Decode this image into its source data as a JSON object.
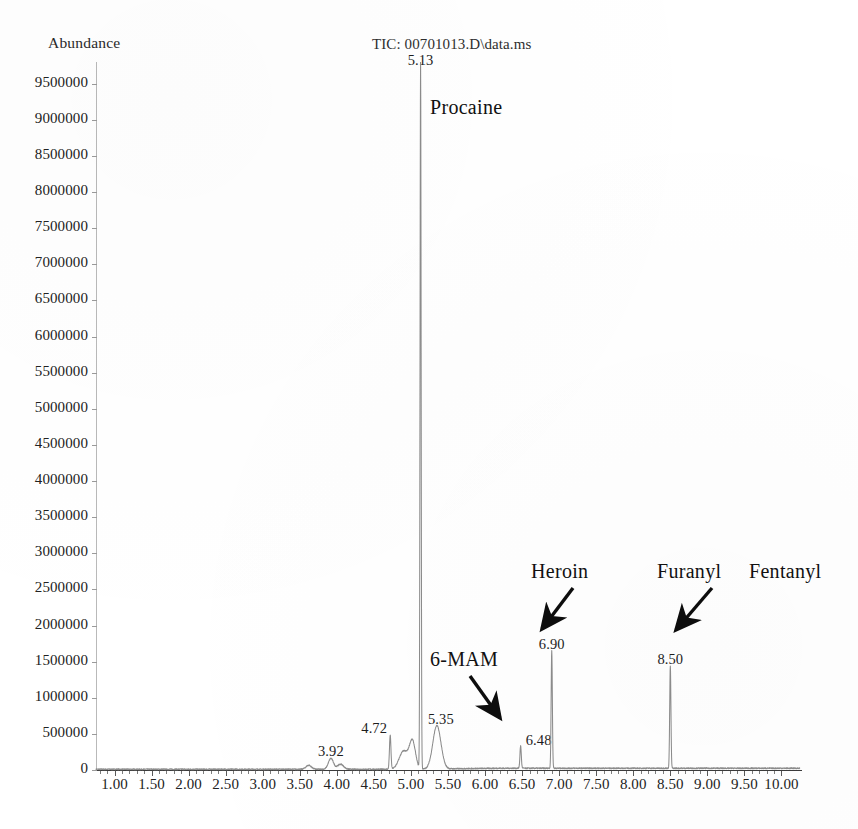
{
  "chart_data": {
    "type": "line",
    "title": "TIC: 00701013.D\\data.ms",
    "ylabel": "Abundance",
    "xlabel": "",
    "xlim": [
      0.75,
      10.25
    ],
    "ylim": [
      0,
      9800000
    ],
    "grid": false,
    "legend": "none",
    "x_ticks": [
      "1.00",
      "1.50",
      "2.00",
      "2.50",
      "3.00",
      "3.50",
      "4.00",
      "4.50",
      "5.00",
      "5.50",
      "6.00",
      "6.50",
      "7.00",
      "7.50",
      "8.00",
      "8.50",
      "9.00",
      "9.50",
      "10.00"
    ],
    "x_tick_values": [
      1.0,
      1.5,
      2.0,
      2.5,
      3.0,
      3.5,
      4.0,
      4.5,
      5.0,
      5.5,
      6.0,
      6.5,
      7.0,
      7.5,
      8.0,
      8.5,
      9.0,
      9.5,
      10.0
    ],
    "y_ticks": [
      "0",
      "500000",
      "1000000",
      "1500000",
      "2000000",
      "2500000",
      "3000000",
      "3500000",
      "4000000",
      "4500000",
      "5000000",
      "5500000",
      "6000000",
      "6500000",
      "7000000",
      "7500000",
      "8000000",
      "8500000",
      "9000000",
      "9500000"
    ],
    "y_tick_values": [
      0,
      500000,
      1000000,
      1500000,
      2000000,
      2500000,
      3000000,
      3500000,
      4000000,
      4500000,
      5000000,
      5500000,
      6000000,
      6500000,
      7000000,
      7500000,
      8000000,
      8500000,
      9000000,
      9500000
    ],
    "peaks": [
      {
        "label": "3.92",
        "rt": 3.92,
        "height": 150000,
        "width": 0.075,
        "label_dx": 0,
        "label_dy": -16
      },
      {
        "label": "4.72",
        "rt": 4.72,
        "height": 470000,
        "width": 0.022,
        "label_dx": -16,
        "label_dy": -16
      },
      {
        "label": "5.13",
        "rt": 5.13,
        "height": 9800000,
        "width": 0.016,
        "label_dx": 0,
        "label_dy": -14
      },
      {
        "label": "5.35",
        "rt": 5.35,
        "height": 600000,
        "width": 0.12,
        "label_dx": 4,
        "label_dy": -16
      },
      {
        "label": "6.48",
        "rt": 6.48,
        "height": 310000,
        "width": 0.02,
        "label_dx": 18,
        "label_dy": -16
      },
      {
        "label": "6.90",
        "rt": 6.9,
        "height": 1630000,
        "width": 0.018,
        "label_dx": 0,
        "label_dy": -16
      },
      {
        "label": "8.50",
        "rt": 8.5,
        "height": 1420000,
        "width": 0.018,
        "label_dx": 0,
        "label_dy": -16
      }
    ],
    "shoulders": [
      {
        "rt": 4.9,
        "height": 250000,
        "width": 0.13
      },
      {
        "rt": 5.02,
        "height": 380000,
        "width": 0.09
      },
      {
        "rt": 3.62,
        "height": 55000,
        "width": 0.08
      },
      {
        "rt": 4.05,
        "height": 70000,
        "width": 0.09
      }
    ],
    "annotations": [
      {
        "text": "Procaine",
        "x": 430,
        "y": 96,
        "arrow": false
      },
      {
        "text": "6-MAM",
        "x": 430,
        "y": 648,
        "arrow": true,
        "arrow_from": [
          470,
          676
        ],
        "arrow_to": [
          500,
          718
        ]
      },
      {
        "text": "Heroin",
        "x": 531,
        "y": 560,
        "arrow": true,
        "arrow_from": [
          573,
          588
        ],
        "arrow_to": [
          542,
          629
        ]
      },
      {
        "text": "Furanyl",
        "x": 657,
        "y": 560,
        "arrow": true,
        "arrow_from": [
          712,
          588
        ],
        "arrow_to": [
          676,
          630
        ]
      },
      {
        "text": "Fentanyl",
        "x": 749,
        "y": 560,
        "arrow": false
      }
    ],
    "compounds": [
      "Procaine",
      "6-MAM",
      "Heroin",
      "Furanyl Fentanyl"
    ],
    "trace_color": "#8c8c8c",
    "axis_color": "#3b3b3b",
    "text_color": "#1a1a1a"
  }
}
